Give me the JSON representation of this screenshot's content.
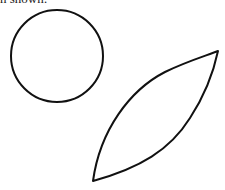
{
  "caption": {
    "text": "n shown:"
  },
  "figure": {
    "stroke_color": "#111111",
    "shapes": [
      {
        "type": "circle",
        "label": "circle",
        "cx": 57,
        "cy": 56,
        "r": 46
      },
      {
        "type": "leaf",
        "label": "leaf-shape",
        "tip_bottom": [
          93,
          181
        ],
        "tip_top": [
          218,
          51
        ]
      }
    ]
  }
}
